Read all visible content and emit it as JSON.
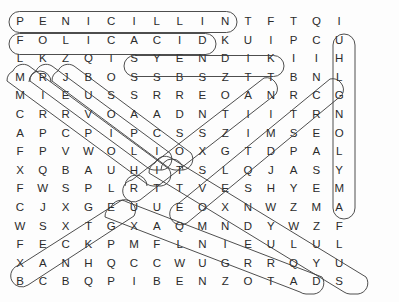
{
  "puzzle": {
    "type": "word-search",
    "rows": 15,
    "cols": 15,
    "letter_color": "#2b2b2b",
    "mark_color": "#3a3a3a",
    "background": "#ffffff",
    "grid": [
      [
        "P",
        "E",
        "N",
        "I",
        "C",
        "I",
        "L",
        "L",
        "I",
        "N",
        "T",
        "F",
        "T",
        "Q",
        "I"
      ],
      [
        "F",
        "O",
        "L",
        "I",
        "C",
        "A",
        "C",
        "I",
        "D",
        "K",
        "U",
        "I",
        "P",
        "C",
        "U"
      ],
      [
        "L",
        "K",
        "Z",
        "Q",
        "I",
        "S",
        "Y",
        "E",
        "N",
        "D",
        "I",
        "K",
        "I",
        "I",
        "H"
      ],
      [
        "M",
        "R",
        "J",
        "B",
        "O",
        "S",
        "S",
        "B",
        "S",
        "Z",
        "T",
        "T",
        "B",
        "N",
        "L"
      ],
      [
        "M",
        "I",
        "E",
        "U",
        "S",
        "S",
        "R",
        "R",
        "E",
        "O",
        "A",
        "N",
        "R",
        "C",
        "G"
      ],
      [
        "C",
        "R",
        "R",
        "V",
        "O",
        "A",
        "A",
        "D",
        "N",
        "T",
        "I",
        "I",
        "T",
        "R",
        "N"
      ],
      [
        "A",
        "P",
        "C",
        "P",
        "I",
        "P",
        "C",
        "S",
        "S",
        "Z",
        "I",
        "M",
        "S",
        "E",
        "O"
      ],
      [
        "F",
        "P",
        "V",
        "W",
        "O",
        "L",
        "I",
        "O",
        "X",
        "G",
        "T",
        "D",
        "P",
        "A",
        "L"
      ],
      [
        "X",
        "Q",
        "B",
        "A",
        "U",
        "H",
        "I",
        "T",
        "S",
        "L",
        "Q",
        "J",
        "A",
        "S",
        "Y"
      ],
      [
        "F",
        "W",
        "S",
        "P",
        "L",
        "R",
        "T",
        "T",
        "V",
        "E",
        "S",
        "H",
        "Y",
        "E",
        "M"
      ],
      [
        "C",
        "J",
        "X",
        "G",
        "E",
        "U",
        "U",
        "E",
        "O",
        "X",
        "N",
        "W",
        "Z",
        "M",
        "A"
      ],
      [
        "W",
        "S",
        "X",
        "T",
        "G",
        "X",
        "A",
        "Q",
        "M",
        "N",
        "D",
        "Y",
        "W",
        "Z",
        "F"
      ],
      [
        "F",
        "E",
        "C",
        "K",
        "P",
        "M",
        "F",
        "L",
        "N",
        "I",
        "E",
        "U",
        "L",
        "U",
        "L"
      ],
      [
        "X",
        "A",
        "N",
        "H",
        "Q",
        "C",
        "C",
        "W",
        "U",
        "G",
        "R",
        "R",
        "Q",
        "Y",
        "U"
      ],
      [
        "B",
        "C",
        "B",
        "Q",
        "P",
        "I",
        "B",
        "E",
        "N",
        "Z",
        "O",
        "T",
        "A",
        "D",
        "S"
      ]
    ],
    "found_words": [
      {
        "word": "PENICILLIN",
        "direction": "horizontal",
        "row": 0,
        "start_col": 0,
        "end_col": 9
      },
      {
        "word": "FOLIC ACID",
        "direction": "horizontal",
        "row": 1,
        "start_col": 0,
        "end_col": 8
      },
      {
        "word": "SYENDIK",
        "direction": "horizontal",
        "row": 2,
        "start_col": 5,
        "end_col": 11
      },
      {
        "word": "INCREASE",
        "direction": "vertical",
        "col": 13,
        "start_row": 1,
        "end_row": 9
      },
      {
        "word": "MIRRORLIKE-DIAGONAL-1",
        "direction": "diagonal-down-right",
        "start_row": 3,
        "start_col": 0,
        "end_row": 9,
        "end_col": 6
      },
      {
        "word": "DIAGONAL-2",
        "direction": "diagonal-down-right",
        "start_row": 3,
        "start_col": 1,
        "end_row": 8,
        "end_col": 6
      },
      {
        "word": "DIAGONAL-3",
        "direction": "diagonal-down-right",
        "start_row": 2,
        "start_col": 2,
        "end_row": 7,
        "end_col": 7
      },
      {
        "word": "DIAGONAL-UP-1",
        "direction": "diagonal-up-right",
        "start_row": 8,
        "start_col": 5,
        "end_row": 3,
        "end_col": 10
      },
      {
        "word": "DIAGONAL-UP-2",
        "direction": "diagonal-up-right",
        "start_row": 9,
        "start_col": 7,
        "end_row": 3,
        "end_col": 13
      },
      {
        "word": "BENZOATE-DIAG-1",
        "direction": "diagonal-down-right",
        "start_row": 9,
        "start_col": 4,
        "end_row": 14,
        "end_col": 12
      },
      {
        "word": "BENZOATE-DIAG-2",
        "direction": "diagonal-down-right",
        "start_row": 7,
        "start_col": 6,
        "end_row": 14,
        "end_col": 13
      },
      {
        "word": "BOTTOM-LEFT-DIAG",
        "direction": "diagonal-up-right",
        "start_row": 14,
        "start_col": 0,
        "end_row": 10,
        "end_col": 4
      }
    ]
  }
}
